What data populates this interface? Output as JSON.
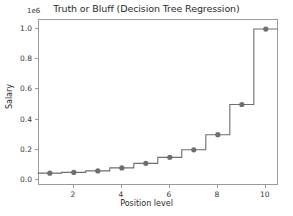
{
  "chart_data": {
    "type": "line",
    "title": "Truth or Bluff (Decision Tree Regression)",
    "xlabel": "Position level",
    "ylabel": "Salary",
    "y_offset_text": "1e6",
    "y_offset_factor": 1000000,
    "grid": false,
    "legend": null,
    "xlim": [
      0.55,
      10.55
    ],
    "ylim": [
      -0.04,
      1.06
    ],
    "xticks": [
      2,
      4,
      6,
      8,
      10
    ],
    "xtick_labels": [
      "2",
      "4",
      "6",
      "8",
      "10"
    ],
    "yticks": [
      0.0,
      0.2,
      0.4,
      0.6,
      0.8,
      1.0
    ],
    "ytick_labels": [
      "0.0",
      "0.2",
      "0.4",
      "0.6",
      "0.8",
      "1.0"
    ],
    "series": [
      {
        "name": "Decision Tree prediction",
        "kind": "step",
        "step_where": "mid",
        "color": "#6e6e6e",
        "x": [
          1,
          2,
          3,
          4,
          5,
          6,
          7,
          8,
          9,
          10
        ],
        "values": [
          0.045,
          0.05,
          0.06,
          0.08,
          0.11,
          0.15,
          0.2,
          0.3,
          0.5,
          1.0
        ]
      },
      {
        "name": "Observed salaries",
        "kind": "scatter",
        "color": "#6e6e6e",
        "marker": "circle",
        "x": [
          1,
          2,
          3,
          4,
          5,
          6,
          7,
          8,
          9,
          10
        ],
        "values": [
          0.045,
          0.05,
          0.06,
          0.08,
          0.11,
          0.15,
          0.2,
          0.3,
          0.5,
          1.0
        ]
      }
    ]
  },
  "figure": {
    "background_color": "#ffffff",
    "axes_color": "#9a9a9a",
    "text_color": "#2b2b2b"
  }
}
